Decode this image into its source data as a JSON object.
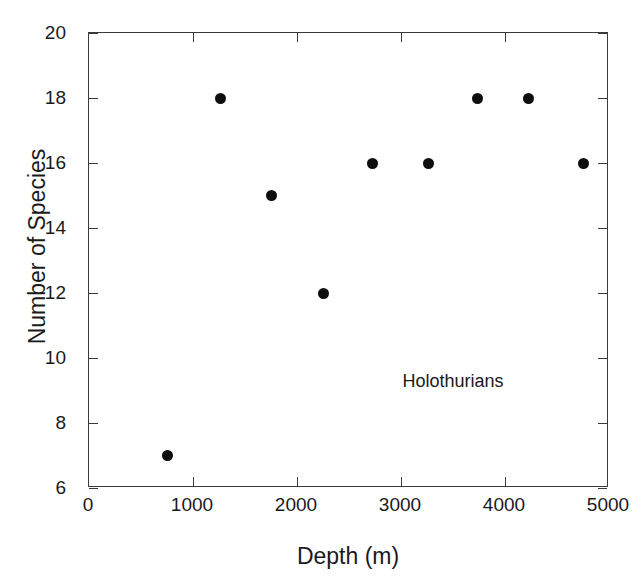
{
  "chart_data": {
    "type": "scatter",
    "title": "",
    "xlabel": "Depth (m)",
    "ylabel": "Number of Species",
    "xlim": [
      0,
      5000
    ],
    "ylim": [
      6,
      20
    ],
    "xticks": [
      0,
      1000,
      2000,
      3000,
      4000,
      5000
    ],
    "xticklabels": [
      "0",
      "1000",
      "2000",
      "3000",
      "4000",
      "5000"
    ],
    "yticks": [
      6,
      8,
      10,
      12,
      14,
      16,
      18,
      20
    ],
    "yticklabels": [
      "6",
      "8",
      "10",
      "12",
      "14",
      "16",
      "18",
      "20"
    ],
    "grid": false,
    "legend": null,
    "marker": "filled-circle",
    "marker_color": "#0d0d0d",
    "annotations": [
      {
        "text": "Holothurians",
        "x": 3500,
        "y": 9.3
      }
    ],
    "series": [
      {
        "name": "Holothurians",
        "x": [
          750,
          1260,
          1750,
          2250,
          2730,
          3260,
          3740,
          4230,
          4750
        ],
        "y": [
          7,
          18,
          15,
          12,
          16,
          16,
          18,
          18,
          16
        ],
        "points": [
          {
            "x": 750,
            "y": 7
          },
          {
            "x": 1260,
            "y": 18
          },
          {
            "x": 1750,
            "y": 15
          },
          {
            "x": 2250,
            "y": 12
          },
          {
            "x": 2730,
            "y": 16
          },
          {
            "x": 3260,
            "y": 16
          },
          {
            "x": 3740,
            "y": 18
          },
          {
            "x": 4230,
            "y": 18
          },
          {
            "x": 4750,
            "y": 16
          }
        ]
      }
    ]
  },
  "figure": {
    "background": "#ffffff",
    "axis_color": "#3a3a3a"
  }
}
